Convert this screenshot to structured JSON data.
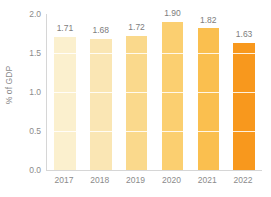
{
  "chart_data": {
    "type": "bar",
    "title": "",
    "subtitle": "",
    "xlabel": "",
    "ylabel": "% of GDP",
    "categories": [
      "2017",
      "2018",
      "2019",
      "2020",
      "2021",
      "2022"
    ],
    "values": [
      1.71,
      1.68,
      1.72,
      1.9,
      1.82,
      1.63
    ],
    "value_labels": [
      "1.71",
      "1.68",
      "1.72",
      "1.90",
      "1.82",
      "1.63"
    ],
    "ylim": [
      0.0,
      2.0
    ],
    "ytick_labels": [
      "0.0",
      "0.5",
      "1.0",
      "1.5",
      "2.0"
    ],
    "ytick_values": [
      0.0,
      0.5,
      1.0,
      1.5,
      2.0
    ],
    "grid": true,
    "grid_axis": "y",
    "legend": false,
    "legend_position": "none",
    "bar_colors": [
      "#FBF0CE",
      "#FAE6B4",
      "#FAD98C",
      "#FBCF70",
      "#FABF4F",
      "#F8981D"
    ],
    "axis_color": "#D6D6D6",
    "label_color": "#8B8B8B",
    "value_label_color": "#7D7D7D",
    "background": "#FFFFFF"
  }
}
